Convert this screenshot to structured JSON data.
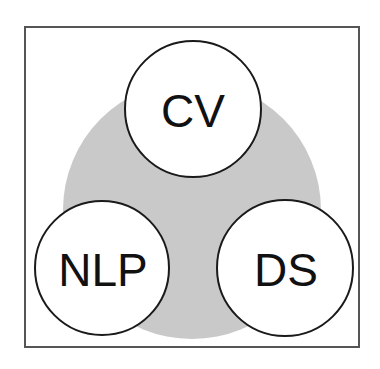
{
  "figure": {
    "type": "venn-trefoil",
    "background_color": "#ffffff",
    "frame": {
      "name": "outer-frame",
      "x": 24,
      "y": 26,
      "width": 336,
      "height": 322,
      "stroke_color": "#555555",
      "stroke_width": 2,
      "fill_color": "#ffffff"
    },
    "backdrop": {
      "name": "shared-intersection-disc",
      "shape": "circle",
      "cx": 192,
      "cy": 210,
      "r": 129,
      "fill_color": "#c9c9c9"
    },
    "circles": [
      {
        "id": "cv",
        "label": "CV",
        "cx": 193,
        "cy": 109,
        "r": 68,
        "fill_color": "#ffffff",
        "stroke_color": "#1a1a1a",
        "stroke_width": 2,
        "label_font_size": 46,
        "position": "top"
      },
      {
        "id": "nlp",
        "label": "NLP",
        "cx": 102,
        "cy": 268,
        "r": 67,
        "fill_color": "#ffffff",
        "stroke_color": "#1a1a1a",
        "stroke_width": 2,
        "label_font_size": 46,
        "position": "bottom-left"
      },
      {
        "id": "ds",
        "label": "DS",
        "cx": 285,
        "cy": 268,
        "r": 68,
        "fill_color": "#ffffff",
        "stroke_color": "#1a1a1a",
        "stroke_width": 2,
        "label_font_size": 46,
        "position": "bottom-right"
      }
    ]
  }
}
